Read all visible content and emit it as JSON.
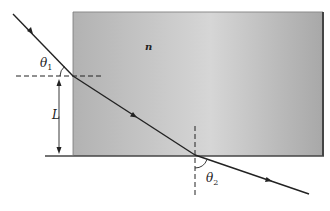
{
  "diagram": {
    "type": "refraction-through-slab",
    "medium_label": "n",
    "angle_in_label": "θ",
    "angle_in_sub": "1",
    "angle_out_label": "θ",
    "angle_out_sub": "2",
    "length_label": "L",
    "colors": {
      "block_light": "#d4d4d4",
      "block_dark": "#a9a9a9",
      "edge": "#555555",
      "ray": "#222222"
    }
  }
}
